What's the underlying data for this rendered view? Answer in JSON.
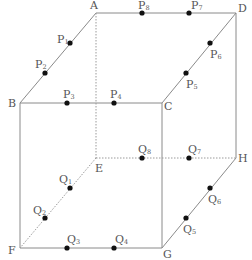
{
  "diagram": {
    "type": "cube-with-points",
    "vertices": [
      {
        "name": "A",
        "x": 96,
        "y": 13,
        "lx": 90,
        "ly": 9
      },
      {
        "name": "D",
        "x": 236,
        "y": 13,
        "lx": 238,
        "ly": 12
      },
      {
        "name": "B",
        "x": 20,
        "y": 103,
        "lx": 8,
        "ly": 107
      },
      {
        "name": "C",
        "x": 162,
        "y": 103,
        "lx": 164,
        "ly": 110
      },
      {
        "name": "E",
        "x": 96,
        "y": 158,
        "lx": 95,
        "ly": 172
      },
      {
        "name": "H",
        "x": 236,
        "y": 158,
        "lx": 238,
        "ly": 162
      },
      {
        "name": "F",
        "x": 20,
        "y": 248,
        "lx": 8,
        "ly": 254
      },
      {
        "name": "G",
        "x": 162,
        "y": 248,
        "lx": 163,
        "ly": 258
      }
    ],
    "solid_edges": [
      [
        "A",
        "D"
      ],
      [
        "A",
        "B"
      ],
      [
        "B",
        "C"
      ],
      [
        "C",
        "D"
      ],
      [
        "D",
        "H"
      ],
      [
        "H",
        "G"
      ],
      [
        "G",
        "F"
      ],
      [
        "F",
        "B"
      ],
      [
        "C",
        "G"
      ]
    ],
    "dashed_edges": [
      [
        "A",
        "E"
      ],
      [
        "E",
        "H"
      ],
      [
        "E",
        "F"
      ]
    ],
    "points": [
      {
        "base": "P",
        "sub": "1",
        "x": 70,
        "y": 43,
        "lx": 57,
        "ly": 43
      },
      {
        "base": "P",
        "sub": "2",
        "x": 45,
        "y": 73,
        "lx": 35,
        "ly": 68
      },
      {
        "base": "P",
        "sub": "3",
        "x": 67,
        "y": 103,
        "lx": 63,
        "ly": 98
      },
      {
        "base": "P",
        "sub": "4",
        "x": 114,
        "y": 103,
        "lx": 110,
        "ly": 98
      },
      {
        "base": "P",
        "sub": "5",
        "x": 186,
        "y": 73,
        "lx": 186,
        "ly": 88
      },
      {
        "base": "P",
        "sub": "6",
        "x": 210,
        "y": 43,
        "lx": 210,
        "ly": 58
      },
      {
        "base": "P",
        "sub": "7",
        "x": 189,
        "y": 13,
        "lx": 191,
        "ly": 9
      },
      {
        "base": "P",
        "sub": "8",
        "x": 142,
        "y": 13,
        "lx": 138,
        "ly": 9
      },
      {
        "base": "Q",
        "sub": "1",
        "x": 70,
        "y": 188,
        "lx": 59,
        "ly": 183
      },
      {
        "base": "Q",
        "sub": "2",
        "x": 45,
        "y": 218,
        "lx": 33,
        "ly": 214
      },
      {
        "base": "Q",
        "sub": "3",
        "x": 67,
        "y": 248,
        "lx": 67,
        "ly": 243
      },
      {
        "base": "Q",
        "sub": "4",
        "x": 114,
        "y": 248,
        "lx": 115,
        "ly": 243
      },
      {
        "base": "Q",
        "sub": "5",
        "x": 186,
        "y": 218,
        "lx": 183,
        "ly": 233
      },
      {
        "base": "Q",
        "sub": "6",
        "x": 210,
        "y": 188,
        "lx": 208,
        "ly": 203
      },
      {
        "base": "Q",
        "sub": "7",
        "x": 189,
        "y": 158,
        "lx": 188,
        "ly": 153
      },
      {
        "base": "Q",
        "sub": "8",
        "x": 142,
        "y": 158,
        "lx": 138,
        "ly": 153
      }
    ]
  },
  "colors": {
    "edge": "#8a8a8a",
    "dashed": "#9a9a9a",
    "point": "#111111",
    "label": "#555555"
  }
}
